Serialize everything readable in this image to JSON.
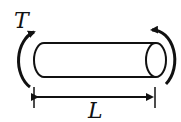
{
  "diagram": {
    "torque_label": "T",
    "length_label": "L",
    "stroke_color": "#111111"
  }
}
